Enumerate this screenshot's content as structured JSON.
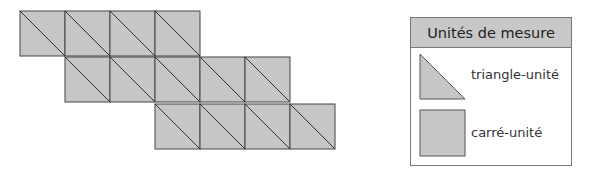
{
  "figure": {
    "cell_size": 45,
    "fill": "#c6c6c6",
    "stroke": "#444444",
    "rows": [
      {
        "x": 20,
        "y": 11,
        "count": 4
      },
      {
        "x": 65,
        "y": 57,
        "count": 5
      },
      {
        "x": 155,
        "y": 104,
        "count": 4
      }
    ],
    "total_squares": 13,
    "total_triangles": 26
  },
  "legend": {
    "title": "Unités de mesure",
    "items": [
      {
        "shape": "triangle",
        "label": "triangle-unité"
      },
      {
        "shape": "square",
        "label": "carré-unité"
      }
    ]
  }
}
